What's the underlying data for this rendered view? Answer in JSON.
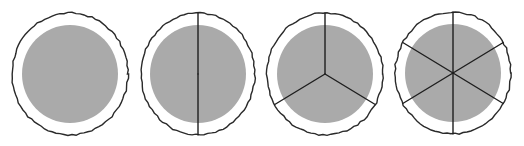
{
  "diagram": {
    "title": "",
    "colors": {
      "outline": "#2a2a2a",
      "fill": "#aaaaaa",
      "spoke": "#1e1e1e",
      "background": "#ffffff"
    },
    "circles": [
      {
        "id": "circle-whole",
        "cx": 70,
        "cy": 74,
        "rx": 58,
        "ry": 61,
        "inner_r": 48,
        "parts": 1,
        "start_angle": 0
      },
      {
        "id": "circle-halves",
        "cx": 198,
        "cy": 74,
        "rx": 57,
        "ry": 61,
        "inner_r": 48,
        "parts": 2,
        "start_angle": 0
      },
      {
        "id": "circle-thirds",
        "cx": 325,
        "cy": 74,
        "rx": 58,
        "ry": 61,
        "inner_r": 48,
        "parts": 3,
        "start_angle": 0
      },
      {
        "id": "circle-sixths",
        "cx": 453,
        "cy": 73,
        "rx": 58,
        "ry": 61,
        "inner_r": 48,
        "parts": 6,
        "start_angle": 0
      }
    ]
  }
}
